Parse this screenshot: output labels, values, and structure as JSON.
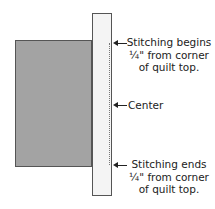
{
  "diagram": {
    "shapes": {
      "quilt_top": {
        "color": "#a3a3a3",
        "border": "#555555"
      },
      "binding_strip": {
        "color": "#f4f4f4",
        "border": "#555555"
      },
      "stitching_line": {
        "style": "dotted",
        "color": "#777777"
      }
    },
    "labels": {
      "begin": {
        "line1": "Stitching begins",
        "line2": "¼\" from corner",
        "line3": "of quilt top."
      },
      "center": {
        "text": "Center"
      },
      "end": {
        "line1": "Stitching ends",
        "line2": "¼\" from corner",
        "line3": "of quilt top."
      }
    },
    "arrows": [
      "arrow-left-icon",
      "arrow-left-icon",
      "arrow-left-icon"
    ]
  }
}
